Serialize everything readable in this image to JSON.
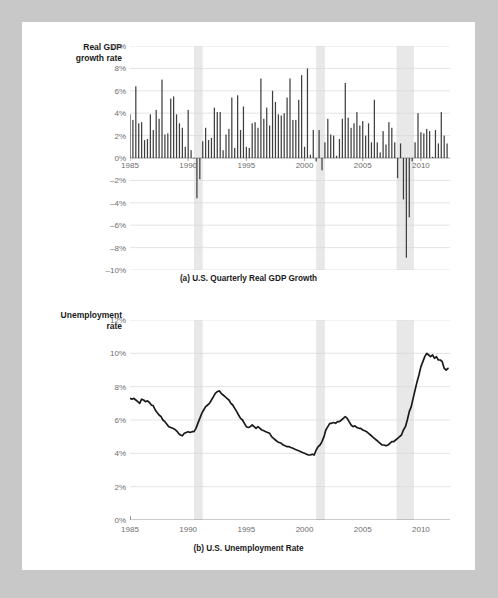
{
  "page": {
    "background_color": "#ffffff",
    "outer_background_color": "#c8c8c8"
  },
  "colors": {
    "bar": "#3d3d3d",
    "line": "#1a1a1a",
    "recession_band": "#e8e8e8",
    "gridline": "#d8d8d8",
    "axis": "#8c8c8c",
    "tick_label": "#6e6e6e",
    "title": "#1a1a1a"
  },
  "chart_data": [
    {
      "id": "panel-a",
      "type": "bar",
      "title": "",
      "caption": "(a) U.S. Quarterly Real GDP Growth",
      "axis_title": "Real GDP\ngrowth rate",
      "xlabel": "",
      "ylabel": "Real GDP growth rate",
      "ylim": [
        -10,
        10
      ],
      "xlim": [
        1985.0,
        2012.5
      ],
      "grid": true,
      "legend": "none",
      "yticks": [
        10,
        8,
        6,
        4,
        2,
        0,
        -2,
        -4,
        -6,
        -8,
        -10
      ],
      "ytick_labels": [
        "10%",
        "8%",
        "6%",
        "4%",
        "2%",
        "0%",
        "–2%",
        "–4%",
        "–6%",
        "–8%",
        "–10%"
      ],
      "xticks": [
        1985,
        1990,
        1995,
        2000,
        2005,
        2010
      ],
      "xtick_labels": [
        "1985",
        "1990",
        "1995",
        "2000",
        "2005",
        "2010"
      ],
      "recession_bands": [
        [
          1990.5,
          1991.25
        ],
        [
          2001.0,
          2001.75
        ],
        [
          2007.9,
          2009.4
        ]
      ],
      "x": [
        1985.0,
        1985.25,
        1985.5,
        1985.75,
        1986.0,
        1986.25,
        1986.5,
        1986.75,
        1987.0,
        1987.25,
        1987.5,
        1987.75,
        1988.0,
        1988.25,
        1988.5,
        1988.75,
        1989.0,
        1989.25,
        1989.5,
        1989.75,
        1990.0,
        1990.25,
        1990.5,
        1990.75,
        1991.0,
        1991.25,
        1991.5,
        1991.75,
        1992.0,
        1992.25,
        1992.5,
        1992.75,
        1993.0,
        1993.25,
        1993.5,
        1993.75,
        1994.0,
        1994.25,
        1994.5,
        1994.75,
        1995.0,
        1995.25,
        1995.5,
        1995.75,
        1996.0,
        1996.25,
        1996.5,
        1996.75,
        1997.0,
        1997.25,
        1997.5,
        1997.75,
        1998.0,
        1998.25,
        1998.5,
        1998.75,
        1999.0,
        1999.25,
        1999.5,
        1999.75,
        2000.0,
        2000.25,
        2000.5,
        2000.75,
        2001.0,
        2001.25,
        2001.5,
        2001.75,
        2002.0,
        2002.25,
        2002.5,
        2002.75,
        2003.0,
        2003.25,
        2003.5,
        2003.75,
        2004.0,
        2004.25,
        2004.5,
        2004.75,
        2005.0,
        2005.25,
        2005.5,
        2005.75,
        2006.0,
        2006.25,
        2006.5,
        2006.75,
        2007.0,
        2007.25,
        2007.5,
        2007.75,
        2008.0,
        2008.25,
        2008.5,
        2008.75,
        2009.0,
        2009.25,
        2009.5,
        2009.75,
        2010.0,
        2010.25,
        2010.5,
        2010.75,
        2011.0,
        2011.25,
        2011.5,
        2011.75,
        2012.0,
        2012.25
      ],
      "values": [
        3.9,
        3.4,
        6.4,
        3.1,
        3.2,
        1.6,
        1.7,
        3.9,
        2.5,
        4.3,
        3.5,
        7.0,
        2.1,
        2.2,
        5.3,
        5.5,
        3.9,
        3.1,
        2.7,
        1.0,
        4.3,
        0.7,
        0.0,
        -3.6,
        -1.9,
        1.5,
        2.7,
        1.6,
        1.8,
        4.5,
        4.1,
        4.1,
        0.7,
        2.1,
        2.6,
        5.4,
        0.9,
        5.6,
        2.5,
        4.6,
        1.0,
        0.9,
        3.1,
        3.2,
        2.7,
        7.1,
        3.5,
        4.5,
        2.9,
        6.0,
        5.0,
        3.9,
        3.8,
        4.0,
        5.4,
        7.1,
        3.4,
        3.4,
        5.2,
        7.4,
        1.0,
        8.0,
        0.3,
        2.5,
        -0.3,
        2.5,
        -1.1,
        1.4,
        3.5,
        2.1,
        2.0,
        0.2,
        1.7,
        3.5,
        6.7,
        3.6,
        2.7,
        3.1,
        4.1,
        2.9,
        3.3,
        2.0,
        3.1,
        1.4,
        5.2,
        1.4,
        0.5,
        2.4,
        1.2,
        3.2,
        2.7,
        1.4,
        -1.8,
        1.3,
        -3.7,
        -8.9,
        -5.3,
        -0.3,
        1.4,
        4.0,
        2.3,
        2.2,
        2.6,
        2.4,
        0.1,
        2.5,
        1.3,
        4.1,
        2.0,
        1.3
      ]
    },
    {
      "id": "panel-b",
      "type": "line",
      "title": "",
      "caption": "(b) U.S. Unemployment Rate",
      "axis_title": "Unemployment\nrate",
      "xlabel": "",
      "ylabel": "Unemployment rate",
      "ylim": [
        0,
        12
      ],
      "xlim": [
        1985.0,
        2012.5
      ],
      "grid": true,
      "legend": "none",
      "yticks": [
        12,
        10,
        8,
        6,
        4,
        2,
        0
      ],
      "ytick_labels": [
        "12%",
        "10%",
        "8%",
        "6%",
        "4%",
        "2%",
        "0%"
      ],
      "xticks": [
        1985,
        1990,
        1995,
        2000,
        2005,
        2010
      ],
      "xtick_labels": [
        "1985",
        "1990",
        "1995",
        "2000",
        "2005",
        "2010"
      ],
      "recession_bands": [
        [
          1990.5,
          1991.25
        ],
        [
          2001.0,
          2001.75
        ],
        [
          2007.9,
          2009.4
        ]
      ],
      "series": [
        {
          "name": "Unemployment rate",
          "x": [
            1985.0,
            1985.17,
            1985.33,
            1985.5,
            1985.67,
            1985.83,
            1986.0,
            1986.17,
            1986.33,
            1986.5,
            1986.67,
            1986.83,
            1987.0,
            1987.17,
            1987.33,
            1987.5,
            1987.67,
            1987.83,
            1988.0,
            1988.17,
            1988.33,
            1988.5,
            1988.67,
            1988.83,
            1989.0,
            1989.17,
            1989.33,
            1989.5,
            1989.67,
            1989.83,
            1990.0,
            1990.17,
            1990.33,
            1990.5,
            1990.67,
            1990.83,
            1991.0,
            1991.17,
            1991.33,
            1991.5,
            1991.67,
            1991.83,
            1992.0,
            1992.17,
            1992.33,
            1992.5,
            1992.67,
            1992.83,
            1993.0,
            1993.17,
            1993.33,
            1993.5,
            1993.67,
            1993.83,
            1994.0,
            1994.17,
            1994.33,
            1994.5,
            1994.67,
            1994.83,
            1995.0,
            1995.17,
            1995.33,
            1995.5,
            1995.67,
            1995.83,
            1996.0,
            1996.17,
            1996.33,
            1996.5,
            1996.67,
            1996.83,
            1997.0,
            1997.17,
            1997.33,
            1997.5,
            1997.67,
            1997.83,
            1998.0,
            1998.17,
            1998.33,
            1998.5,
            1998.67,
            1998.83,
            1999.0,
            1999.17,
            1999.33,
            1999.5,
            1999.67,
            1999.83,
            2000.0,
            2000.17,
            2000.33,
            2000.5,
            2000.67,
            2000.83,
            2001.0,
            2001.17,
            2001.33,
            2001.5,
            2001.67,
            2001.83,
            2002.0,
            2002.17,
            2002.33,
            2002.5,
            2002.67,
            2002.83,
            2003.0,
            2003.17,
            2003.33,
            2003.5,
            2003.67,
            2003.83,
            2004.0,
            2004.17,
            2004.33,
            2004.5,
            2004.67,
            2004.83,
            2005.0,
            2005.17,
            2005.33,
            2005.5,
            2005.67,
            2005.83,
            2006.0,
            2006.17,
            2006.33,
            2006.5,
            2006.67,
            2006.83,
            2007.0,
            2007.17,
            2007.33,
            2007.5,
            2007.67,
            2007.83,
            2008.0,
            2008.17,
            2008.33,
            2008.5,
            2008.67,
            2008.83,
            2009.0,
            2009.17,
            2009.33,
            2009.5,
            2009.67,
            2009.83,
            2010.0,
            2010.17,
            2010.33,
            2010.5,
            2010.67,
            2010.83,
            2011.0,
            2011.17,
            2011.33,
            2011.5,
            2011.67,
            2011.83,
            2012.0,
            2012.17,
            2012.33
          ],
          "values": [
            7.3,
            7.25,
            7.3,
            7.2,
            7.1,
            7.0,
            7.25,
            7.2,
            7.1,
            7.15,
            7.05,
            6.9,
            6.85,
            6.6,
            6.45,
            6.3,
            6.2,
            6.0,
            5.9,
            5.75,
            5.6,
            5.55,
            5.5,
            5.45,
            5.35,
            5.2,
            5.1,
            5.05,
            5.2,
            5.25,
            5.3,
            5.25,
            5.3,
            5.3,
            5.5,
            5.8,
            6.1,
            6.4,
            6.6,
            6.8,
            6.9,
            7.0,
            7.2,
            7.4,
            7.6,
            7.7,
            7.75,
            7.6,
            7.5,
            7.4,
            7.3,
            7.2,
            7.0,
            6.9,
            6.7,
            6.5,
            6.3,
            6.1,
            6.0,
            5.8,
            5.6,
            5.55,
            5.6,
            5.7,
            5.6,
            5.5,
            5.6,
            5.5,
            5.4,
            5.35,
            5.3,
            5.25,
            5.2,
            5.0,
            4.9,
            4.8,
            4.7,
            4.65,
            4.6,
            4.5,
            4.45,
            4.4,
            4.4,
            4.35,
            4.3,
            4.25,
            4.2,
            4.15,
            4.1,
            4.05,
            4.0,
            3.95,
            3.9,
            3.9,
            3.95,
            3.9,
            4.2,
            4.4,
            4.5,
            4.7,
            5.0,
            5.4,
            5.6,
            5.8,
            5.8,
            5.85,
            5.8,
            5.9,
            5.9,
            6.0,
            6.1,
            6.2,
            6.1,
            5.9,
            5.7,
            5.6,
            5.65,
            5.55,
            5.5,
            5.5,
            5.4,
            5.35,
            5.3,
            5.2,
            5.1,
            5.0,
            4.9,
            4.8,
            4.7,
            4.6,
            4.5,
            4.5,
            4.45,
            4.5,
            4.6,
            4.7,
            4.7,
            4.8,
            4.9,
            5.0,
            5.1,
            5.4,
            5.6,
            6.0,
            6.5,
            6.8,
            7.3,
            7.8,
            8.3,
            8.7,
            9.2,
            9.5,
            9.8,
            10.0,
            9.9,
            9.8,
            9.9,
            9.7,
            9.8,
            9.6,
            9.6,
            9.5,
            9.1,
            9.0,
            9.1,
            9.0,
            9.0,
            8.9,
            8.7,
            8.5,
            8.3,
            8.2,
            8.1,
            8.2
          ]
        }
      ]
    }
  ]
}
